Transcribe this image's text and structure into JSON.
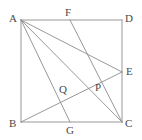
{
  "figure": {
    "stroke_color": "#8c8c8c",
    "label_color": "#4a4a4a",
    "background_color": "#ffffff",
    "stroke_width": 0.9,
    "canvas": {
      "width": 142,
      "height": 140
    }
  },
  "points": {
    "A": {
      "label": "A",
      "x": 21,
      "y": 20,
      "label_x": 9,
      "label_y": 13
    },
    "B": {
      "label": "B",
      "x": 21,
      "y": 122,
      "label_x": 9,
      "label_y": 118
    },
    "C": {
      "label": "C",
      "x": 122,
      "y": 122,
      "label_x": 125,
      "label_y": 118
    },
    "D": {
      "label": "D",
      "x": 122,
      "y": 20,
      "label_x": 125,
      "label_y": 13
    },
    "E": {
      "label": "E",
      "x": 122,
      "y": 72,
      "label_x": 126,
      "label_y": 66
    },
    "F": {
      "label": "F",
      "x": 70,
      "y": 20,
      "label_x": 65,
      "label_y": 7
    },
    "G": {
      "label": "G",
      "x": 70,
      "y": 122,
      "label_x": 66,
      "label_y": 125
    },
    "P": {
      "label": "P",
      "x": 100,
      "y": 76,
      "label_x": 95,
      "label_y": 82
    },
    "Q": {
      "label": "Q",
      "x": 67,
      "y": 92,
      "label_x": 59,
      "label_y": 84
    }
  },
  "segments": [
    {
      "name": "side-AD",
      "from": "A",
      "to": "D"
    },
    {
      "name": "side-DC",
      "from": "D",
      "to": "C"
    },
    {
      "name": "side-CB",
      "from": "C",
      "to": "B"
    },
    {
      "name": "side-BA",
      "from": "B",
      "to": "A"
    },
    {
      "name": "cevian-A-to-G",
      "from": "A",
      "to": "G"
    },
    {
      "name": "cevian-A-to-E",
      "from": "A",
      "to": "E"
    },
    {
      "name": "cevian-A-to-C",
      "from": "A",
      "to": "C"
    },
    {
      "name": "cevian-B-to-E",
      "from": "B",
      "to": "E"
    },
    {
      "name": "cevian-F-to-C",
      "from": "F",
      "to": "C"
    }
  ],
  "intersections": [
    {
      "name": "P",
      "of": "A-E with F-C and B-E"
    },
    {
      "name": "Q",
      "of": "A-G with B-E"
    }
  ]
}
